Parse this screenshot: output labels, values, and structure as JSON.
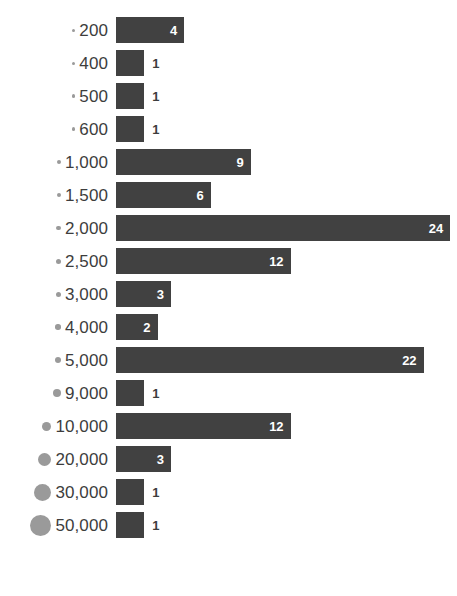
{
  "chart_data": {
    "type": "bar",
    "orientation": "horizontal",
    "title": "",
    "subtitle": "",
    "xlabel": "",
    "ylabel": "",
    "grid": false,
    "legend": null,
    "value_labels": true,
    "xlim": [
      0,
      24
    ],
    "categories": [
      "200",
      "400",
      "500",
      "600",
      "1,000",
      "1,500",
      "2,000",
      "2,500",
      "3,000",
      "4,000",
      "5,000",
      "9,000",
      "10,000",
      "20,000",
      "30,000",
      "50,000"
    ],
    "values": [
      4,
      1,
      1,
      1,
      9,
      6,
      24,
      12,
      3,
      2,
      22,
      1,
      12,
      3,
      1,
      1
    ],
    "bullet_sizes_px": [
      3,
      3,
      3.5,
      3.5,
      4,
      4,
      4.5,
      5,
      5,
      5.5,
      6,
      8,
      9,
      13,
      17,
      21
    ],
    "bar_color": "#414141",
    "bullet_color": "#9a9a9a",
    "label_color": "#3d3d3d",
    "value_label_inside_color": "#ffffff",
    "background_color": "#ffffff",
    "rows": [
      {
        "category": "200",
        "value": 4,
        "value_text": "4",
        "bullet_px": 3
      },
      {
        "category": "400",
        "value": 1,
        "value_text": "1",
        "bullet_px": 3
      },
      {
        "category": "500",
        "value": 1,
        "value_text": "1",
        "bullet_px": 3.5
      },
      {
        "category": "600",
        "value": 1,
        "value_text": "1",
        "bullet_px": 3.5
      },
      {
        "category": "1,000",
        "value": 9,
        "value_text": "9",
        "bullet_px": 4
      },
      {
        "category": "1,500",
        "value": 6,
        "value_text": "6",
        "bullet_px": 4
      },
      {
        "category": "2,000",
        "value": 24,
        "value_text": "24",
        "bullet_px": 4.5
      },
      {
        "category": "2,500",
        "value": 12,
        "value_text": "12",
        "bullet_px": 5
      },
      {
        "category": "3,000",
        "value": 3,
        "value_text": "3",
        "bullet_px": 5
      },
      {
        "category": "4,000",
        "value": 2,
        "value_text": "2",
        "bullet_px": 5.5
      },
      {
        "category": "5,000",
        "value": 22,
        "value_text": "22",
        "bullet_px": 6
      },
      {
        "category": "9,000",
        "value": 1,
        "value_text": "1",
        "bullet_px": 8
      },
      {
        "category": "10,000",
        "value": 12,
        "value_text": "12",
        "bullet_px": 9
      },
      {
        "category": "20,000",
        "value": 3,
        "value_text": "3",
        "bullet_px": 13
      },
      {
        "category": "30,000",
        "value": 1,
        "value_text": "1",
        "bullet_px": 17
      },
      {
        "category": "50,000",
        "value": 1,
        "value_text": "1",
        "bullet_px": 21
      }
    ]
  }
}
